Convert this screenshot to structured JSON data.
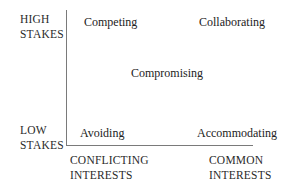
{
  "diagram": {
    "y_axis": {
      "high_label_line1": "HIGH",
      "high_label_line2": "STAKES",
      "low_label_line1": "LOW",
      "low_label_line2": "STAKES"
    },
    "x_axis": {
      "left_label_line1": "CONFLICTING",
      "left_label_line2": "INTERESTS",
      "right_label_line1": "COMMON",
      "right_label_line2": "INTERESTS"
    },
    "styles": {
      "top_left": "Competing",
      "top_right": "Collaborating",
      "center": "Compromising",
      "bottom_left": "Avoiding",
      "bottom_right": "Accommodating"
    },
    "colors": {
      "axis": "#7a7a7a",
      "text": "#222222",
      "background": "#ffffff"
    }
  }
}
